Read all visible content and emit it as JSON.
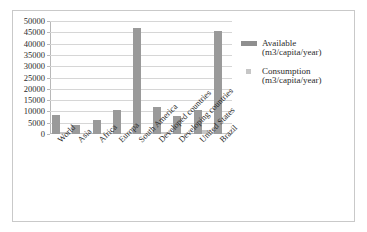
{
  "chart_data": {
    "type": "bar",
    "title": "",
    "xlabel": "",
    "ylabel": "",
    "ylim": [
      0,
      50000
    ],
    "yticks": [
      0,
      5000,
      10000,
      15000,
      20000,
      25000,
      30000,
      35000,
      40000,
      45000,
      50000
    ],
    "ytick_labels": [
      "0",
      "5000",
      "10000",
      "15000",
      "20000",
      "25000",
      "30000",
      "35000",
      "40000",
      "45000",
      "50000"
    ],
    "grid": true,
    "legend_position": "right",
    "categories": [
      "World",
      "Asia",
      "Africa",
      "Europa",
      "South America",
      "Developed countries",
      "Developing countries",
      "United States",
      "Brazil"
    ],
    "series": [
      {
        "name": "Available",
        "unit": "(m3/capita/year)",
        "color": "#9a9a9a",
        "values": [
          8400,
          3900,
          6300,
          10800,
          47000,
          11800,
          7800,
          10500,
          45500
        ]
      },
      {
        "name": "Consumption",
        "unit": "(m3/capita/year)",
        "color": "#c6c6c6",
        "values": [
          700,
          600,
          250,
          600,
          350,
          1100,
          450,
          1900,
          350
        ]
      }
    ]
  },
  "legend": {
    "entries": [
      {
        "name": "Available",
        "unit": "(m3/capita/year)"
      },
      {
        "name": "Consumption",
        "unit": "(m3/capita/year)"
      }
    ]
  }
}
